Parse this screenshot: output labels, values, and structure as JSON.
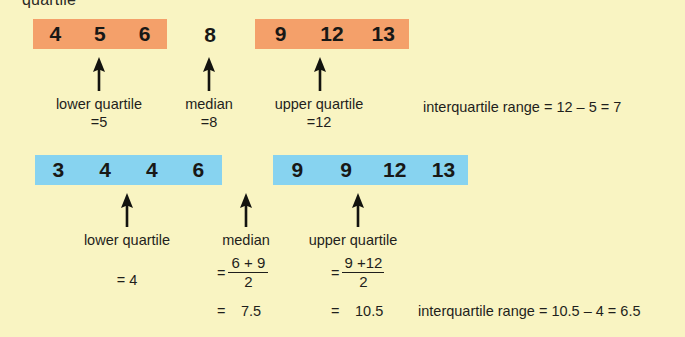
{
  "page": {
    "title_clipped": "quartile",
    "background_color": "#f9f4c2",
    "orange_color": "#f4a06a",
    "blue_color": "#87d3f0"
  },
  "dataset_odd": {
    "lower_box_values": [
      "4",
      "5",
      "6"
    ],
    "median_value": "8",
    "upper_box_values": [
      "9",
      "12",
      "13"
    ],
    "labels": {
      "lower_quartile": "lower quartile",
      "lower_quartile_value": "=5",
      "median": "median",
      "median_value": "=8",
      "upper_quartile": "upper quartile",
      "upper_quartile_value": "=12"
    },
    "iqr_text": "interquartile range = 12 – 5 = 7"
  },
  "dataset_even": {
    "lower_box_values": [
      "3",
      "4",
      "4",
      "6"
    ],
    "upper_box_values": [
      "9",
      "9",
      "12",
      "13"
    ],
    "labels": {
      "lower_quartile": "lower quartile",
      "lower_quartile_value": "= 4",
      "median": "median",
      "upper_quartile": "upper quartile"
    },
    "median_fraction": {
      "equals": "=",
      "numerator": "6 + 9",
      "denominator": "2",
      "result_equals": "=",
      "result": "7.5"
    },
    "upper_quartile_fraction": {
      "equals": "=",
      "numerator": "9 +12",
      "denominator": "2",
      "result_equals": "=",
      "result": "10.5"
    },
    "iqr_text": "interquartile range = 10.5 – 4 = 6.5"
  }
}
